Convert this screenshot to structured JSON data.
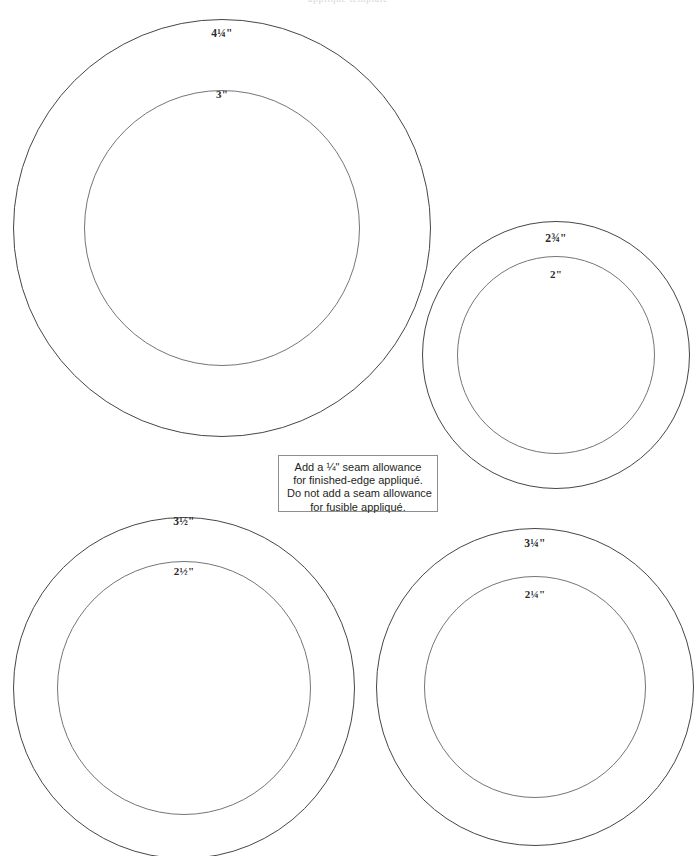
{
  "page": {
    "width": 696,
    "height": 856,
    "background_color": "#ffffff",
    "header_remnant_text": "appliqué template"
  },
  "note": {
    "lines": [
      "Add a ¼\" seam allowance",
      "for finished-edge appliqué.",
      "Do not add a seam allowance",
      "for fusible appliqué."
    ],
    "border_color": "#8d8d92",
    "text_color": "#231f20"
  },
  "colors": {
    "outer_circle_stroke": "#46464a",
    "inner_circle_stroke": "#75757a",
    "label_text": "#2a2a2e"
  },
  "templates": [
    {
      "id": "template-4-25",
      "outer_label": "4¼\"",
      "inner_label": "3\"",
      "outer_diameter_inches": 4.25,
      "inner_diameter_inches": 3,
      "center_x": 222,
      "center_y": 228,
      "outer_radius_px": 209,
      "inner_radius_px": 138
    },
    {
      "id": "template-2-75",
      "outer_label": "2¾\"",
      "inner_label": "2\"",
      "outer_diameter_inches": 2.75,
      "inner_diameter_inches": 2,
      "center_x": 556,
      "center_y": 355,
      "outer_radius_px": 134,
      "inner_radius_px": 99
    },
    {
      "id": "template-3-5",
      "outer_label": "3½\"",
      "inner_label": "2½\"",
      "outer_diameter_inches": 3.5,
      "inner_diameter_inches": 2.5,
      "center_x": 184,
      "center_y": 688,
      "outer_radius_px": 171,
      "inner_radius_px": 127
    },
    {
      "id": "template-3-25",
      "outer_label": "3¼\"",
      "inner_label": "2¼\"",
      "outer_diameter_inches": 3.25,
      "inner_diameter_inches": 2.25,
      "center_x": 535,
      "center_y": 687,
      "outer_radius_px": 159,
      "inner_radius_px": 111
    }
  ]
}
